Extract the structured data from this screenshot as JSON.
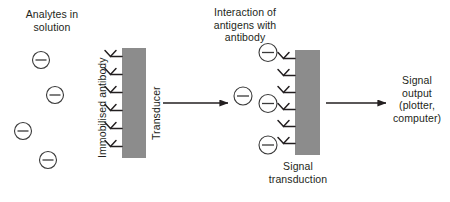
{
  "diagram": {
    "background_color": "#ffffff",
    "ink_color": "#231f20",
    "transducer_color": "#8c8c8c"
  },
  "stage1": {
    "heading": "Analytes in\nsolution",
    "analyte_symbol": "circle-minus",
    "analyte_count": 4,
    "analytes": [
      {
        "x": 41,
        "y": 60,
        "r": 8.5
      },
      {
        "x": 55,
        "y": 95,
        "r": 8.5
      },
      {
        "x": 23,
        "y": 131,
        "r": 8.5
      },
      {
        "x": 48,
        "y": 160,
        "r": 8.5
      }
    ]
  },
  "stage2": {
    "antibody_label": "Immobilised antibody",
    "transducer_label": "Transducer",
    "antibody_count": 6,
    "bar": {
      "x": 122,
      "y": 48,
      "width": 24,
      "height": 110
    }
  },
  "stage3": {
    "heading": "Interaction of\nantigens with\nantibody",
    "caption": "Signal\ntransduction",
    "antibody_count": 6,
    "bound_antigen_positions": [
      0,
      3,
      5
    ],
    "free_antigen": {
      "x": 243,
      "y": 96,
      "r": 9
    },
    "bar": {
      "x": 295,
      "y": 50,
      "width": 25,
      "height": 105
    }
  },
  "stage4": {
    "heading": "Signal\noutput\n(plotter,\ncomputer)"
  },
  "arrows": [
    {
      "name": "arrow-stage1-to-stage3",
      "x1": 163,
      "y1": 103,
      "x2": 228,
      "y2": 103
    },
    {
      "name": "arrow-stage3-to-stage4",
      "x1": 326,
      "y1": 103,
      "x2": 386,
      "y2": 103
    }
  ]
}
